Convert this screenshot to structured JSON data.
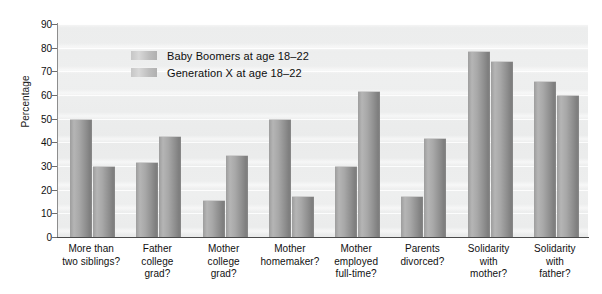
{
  "chart_data": {
    "type": "bar",
    "title": "",
    "xlabel": "",
    "ylabel": "Percentage",
    "ylim": [
      0,
      90
    ],
    "ytick_step": 10,
    "yticks": [
      90,
      80,
      70,
      60,
      50,
      40,
      30,
      20,
      10,
      0
    ],
    "grid": true,
    "legend_position": "upper-left-inside",
    "categories": [
      "More than\ntwo siblings?",
      "Father\ncollege\ngrad?",
      "Mother\ncollege\ngrad?",
      "Mother\nhomemaker?",
      "Mother\nemployed\nfull-time?",
      "Parents\ndivorced?",
      "Solidarity\nwith\nmother?",
      "Solidarity\nwith\nfather?"
    ],
    "category_lines": [
      [
        "More than",
        "two siblings?"
      ],
      [
        "Father",
        "college",
        "grad?"
      ],
      [
        "Mother",
        "college",
        "grad?"
      ],
      [
        "Mother",
        "homemaker?"
      ],
      [
        "Mother",
        "employed",
        "full-time?"
      ],
      [
        "Parents",
        "divorced?"
      ],
      [
        "Solidarity",
        "with",
        "mother?"
      ],
      [
        "Solidarity",
        "with",
        "father?"
      ]
    ],
    "series": [
      {
        "name": "Baby Boomers at age 18–22",
        "values": [
          50,
          31.5,
          15.5,
          50,
          30,
          17.5,
          78.5,
          66
        ]
      },
      {
        "name": "Generation X at age 18–22",
        "values": [
          30,
          42.5,
          34.5,
          17.5,
          61.5,
          42,
          74.5,
          60
        ]
      }
    ]
  },
  "legend": {
    "items": [
      {
        "label": "Baby Boomers at age 18–22"
      },
      {
        "label": "Generation X at age 18–22"
      }
    ]
  },
  "colors": {
    "bar_fill": "#a0a0a0",
    "plot_background": "#ecedec",
    "axis": "#4a4a4a",
    "text": "#111111"
  }
}
